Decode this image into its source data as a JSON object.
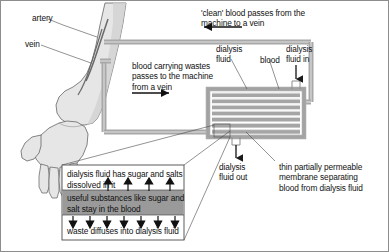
{
  "figure": {
    "frame_color": "#8d8d8d",
    "background": "#ffffff",
    "tube_color": "#a8a8a8",
    "skin_color": "#e4e4e4",
    "band_gray": "#9b9b9b",
    "inset_band_gray": "#9a9a9a"
  },
  "labels": {
    "artery": "artery",
    "vein": "vein",
    "clean_blood": "'clean' blood passes from the\nmachine to a vein",
    "blood_wastes": "blood carrying wastes\npasses to the machine\nfrom a vein",
    "dialysis_fluid": "dialysis\nfluid",
    "blood": "blood",
    "dialysis_fluid_in": "dialysis\nfluid in",
    "dialysis_fluid_out": "dialysis\nfluid out",
    "membrane": "thin partially permeable\nmembrane separating\nblood from dialysis fluid"
  },
  "inset": {
    "top_band": "dialysis fluid has sugar and salts\ndissolved in it",
    "middle_band": "useful substances like sugar and\nsalt stay in the blood",
    "bottom_band": "waste diffuses into dialysis fluid",
    "up_arrow_count": 4,
    "down_arrow_count": 7
  },
  "dialyser": {
    "membrane_stripe_count": 7,
    "stripe_color": "#a5a5a5",
    "casing_color": "#a8a8a8"
  },
  "flow_arrows": {
    "clean_blood_direction": "left",
    "waste_blood_direction": "right",
    "fluid_in_direction": "down",
    "fluid_out_direction": "down"
  }
}
